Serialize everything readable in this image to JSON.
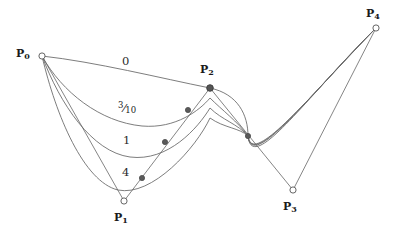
{
  "figure": {
    "width": 401,
    "height": 237,
    "background_color": "#ffffff",
    "curve_color": "#666666",
    "polygon_color": "#777777",
    "marker_fill_open": "#ffffff",
    "marker_fill_solid": "#555555",
    "marker_stroke": "#555555"
  },
  "control_points": [
    {
      "id": "P0",
      "label_base": "P",
      "label_sub": "0",
      "x": 42,
      "y": 56,
      "marker": "open",
      "label_x": 16,
      "label_y": 48
    },
    {
      "id": "P1",
      "label_base": "P",
      "label_sub": "1",
      "x": 124,
      "y": 201,
      "marker": "open",
      "label_x": 114,
      "label_y": 212
    },
    {
      "id": "P2",
      "label_base": "P",
      "label_sub": "2",
      "x": 210,
      "y": 88,
      "marker": "solid",
      "label_x": 200,
      "label_y": 64
    },
    {
      "id": "P3",
      "label_base": "P",
      "label_sub": "3",
      "x": 293,
      "y": 190,
      "marker": "open",
      "label_x": 283,
      "label_y": 201
    },
    {
      "id": "P4",
      "label_base": "P",
      "label_sub": "4",
      "x": 376,
      "y": 28,
      "marker": "open",
      "label_x": 366,
      "label_y": 8
    }
  ],
  "knot_markers": [
    {
      "id": "k1",
      "x": 142,
      "y": 178
    },
    {
      "id": "k2",
      "x": 165,
      "y": 142
    },
    {
      "id": "k3",
      "x": 188,
      "y": 110
    },
    {
      "id": "k4",
      "x": 248,
      "y": 136
    }
  ],
  "weight_labels": [
    {
      "id": "w0",
      "text": "0",
      "kind": "plain",
      "x": 122,
      "y": 56
    },
    {
      "id": "w3_10",
      "text": "3/10",
      "kind": "fraction",
      "numerator": "3",
      "denominator": "10",
      "x": 118,
      "y": 101
    },
    {
      "id": "w1",
      "text": "1",
      "kind": "plain",
      "x": 123,
      "y": 135
    },
    {
      "id": "w4",
      "text": "4",
      "kind": "plain",
      "x": 122,
      "y": 167
    }
  ],
  "chart_data": {
    "type": "line",
    "xlabel": "",
    "ylabel": "",
    "xlim": [
      0,
      401
    ],
    "ylim": [
      237,
      0
    ],
    "grid": false,
    "legend": "inline-labels",
    "control_polygon": {
      "name": "control polygon",
      "x": [
        42,
        124,
        210,
        293,
        376
      ],
      "y": [
        56,
        201,
        88,
        190,
        28
      ]
    },
    "series": [
      {
        "name": "0",
        "weight": 0,
        "path": "M42,56 C96,62 160,78 210,88 C238,94 248,115 248,136 C252,176 308,95 376,28",
        "x": [
          42,
          126,
          210,
          248,
          312,
          376
        ],
        "y": [
          56,
          71,
          88,
          136,
          96,
          28
        ]
      },
      {
        "name": "3/10",
        "weight": 0.3,
        "path": "M42,56 C62,92 100,122 142,126 C176,129 200,110 210,98 C222,110 238,122 248,136 C252,172 308,96 376,28",
        "x": [
          42,
          95,
          142,
          190,
          210,
          248,
          312,
          376
        ],
        "y": [
          56,
          105,
          126,
          108,
          98,
          136,
          96,
          28
        ]
      },
      {
        "name": "1",
        "weight": 1,
        "path": "M42,56 C60,104 92,152 130,157 C168,162 198,128 210,108 C222,120 238,124 248,136 C252,170 308,97 376,28",
        "x": [
          42,
          88,
          130,
          180,
          210,
          248,
          312,
          376
        ],
        "y": [
          56,
          124,
          157,
          134,
          108,
          136,
          97,
          28
        ]
      },
      {
        "name": "4",
        "weight": 4,
        "path": "M42,56 C56,116 84,182 118,190 C152,197 196,148 210,118 C224,128 240,128 248,136 C252,168 308,98 376,28",
        "x": [
          42,
          82,
          118,
          172,
          210,
          248,
          312,
          376
        ],
        "y": [
          56,
          140,
          190,
          160,
          118,
          136,
          98,
          28
        ]
      }
    ]
  }
}
